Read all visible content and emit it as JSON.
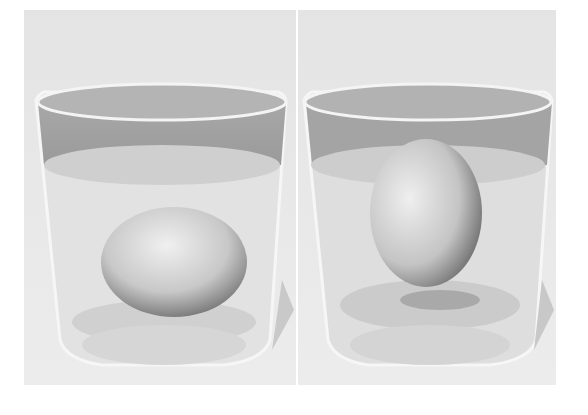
{
  "scene": {
    "description": "Two glasses of water, each containing an egg",
    "panels": [
      {
        "id": "left",
        "subject": "egg-sunk-lying-on-bottom",
        "water_color": "#d8d8d8"
      },
      {
        "id": "right",
        "subject": "egg-floating-upright-in-salt-water",
        "water_color": "#d6d6d6"
      }
    ],
    "colors": {
      "background": "#ffffff",
      "panel": "#e6e6e6",
      "glass_rim": "#9c9c9c",
      "egg_light": "#ececec",
      "egg_dark": "#6a6a6a"
    }
  }
}
